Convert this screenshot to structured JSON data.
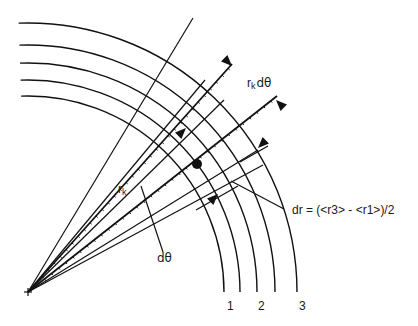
{
  "diagram": {
    "title": "",
    "colors": {
      "line": "#111111",
      "background": "#ffffff"
    },
    "origin": {
      "x": 28,
      "y": 292
    },
    "arcs": [
      {
        "id": "arc-1",
        "radius": 196
      },
      {
        "id": "arc-inner-2",
        "radius": 212
      },
      {
        "id": "arc-2",
        "radius": 229
      },
      {
        "id": "arc-inner-4",
        "radius": 247
      },
      {
        "id": "arc-3",
        "radius": 269
      }
    ],
    "arc_labels": [
      {
        "text": "1",
        "x": 227,
        "y": 310
      },
      {
        "text": "2",
        "x": 258,
        "y": 310
      },
      {
        "text": "3",
        "x": 299,
        "y": 310
      }
    ],
    "radial_lines": [
      {
        "x2": 193,
        "y2": 18,
        "style": "solid"
      },
      {
        "x2": 232,
        "y2": 64,
        "style": "dashed"
      },
      {
        "x2": 205,
        "y2": 80,
        "style": "solid"
      },
      {
        "x2": 224,
        "y2": 100,
        "style": "solid"
      },
      {
        "x2": 277,
        "y2": 96,
        "style": "dashed"
      },
      {
        "x2": 258,
        "y2": 150,
        "style": "solid"
      },
      {
        "x2": 263,
        "y2": 165,
        "style": "solid"
      }
    ],
    "labels": {
      "rk_dtheta": {
        "text_main": "r",
        "text_sub": "k",
        "text_tail": "dθ",
        "x": 247,
        "y": 87
      },
      "rk": {
        "text_main": "r",
        "text_sub": "k",
        "x": 118,
        "y": 193
      },
      "dtheta": {
        "text": "dθ",
        "x": 157,
        "y": 262
      },
      "dr": {
        "text": "dr = (<r3> - <r1>)/2",
        "x": 292,
        "y": 214
      }
    },
    "leaders": {
      "dtheta": {
        "x1": 141,
        "y1": 186,
        "x2": 163,
        "y2": 252
      },
      "dr": {
        "x1": 231,
        "y1": 181,
        "x2": 284,
        "y2": 209
      }
    },
    "dot": {
      "x": 197,
      "y": 164,
      "r": 5
    },
    "arrows": [
      {
        "id": "rk-dtheta-arrow-top",
        "tip_x": 232,
        "tip_y": 66,
        "dir": [
          1,
          1
        ]
      },
      {
        "id": "rk-dtheta-arrow-bottom",
        "tip_x": 276,
        "tip_y": 100,
        "dir": [
          -1,
          -1
        ]
      },
      {
        "id": "rk-arrow",
        "tip_x": 186,
        "tip_y": 128,
        "dir": [
          1,
          -1
        ]
      },
      {
        "id": "dr-arrow-inner",
        "tip_x": 218,
        "tip_y": 194,
        "dir": [
          1,
          -1
        ]
      },
      {
        "id": "dr-arrow-outer",
        "tip_x": 258,
        "tip_y": 148,
        "dir": [
          -1,
          1
        ]
      }
    ]
  }
}
